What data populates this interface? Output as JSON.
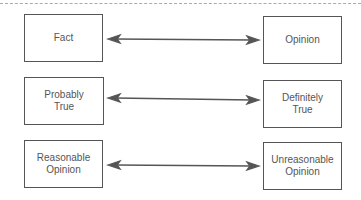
{
  "diagram": {
    "pairs": [
      {
        "left": "Fact",
        "right": "Opinion"
      },
      {
        "left": "Probably True",
        "right": "Definitely True"
      },
      {
        "left": "Reasonable Opinion",
        "right": "Unreasonable Opinion"
      }
    ],
    "connector": "double-headed-arrow",
    "colors": {
      "line": "#555555",
      "dash": "#aaaaaa"
    }
  }
}
